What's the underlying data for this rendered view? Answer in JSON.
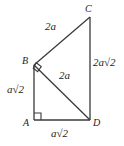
{
  "figure": {
    "type": "geometry-diagram",
    "background_color": "#ffffff",
    "stroke_color": "#3a3a3a",
    "text_color": "#1c1c1c",
    "vertices": [
      {
        "name": "A",
        "label": "A",
        "x": 34,
        "y": 120
      },
      {
        "name": "B",
        "label": "B",
        "x": 34,
        "y": 65
      },
      {
        "name": "C",
        "label": "C",
        "x": 90,
        "y": 17
      },
      {
        "name": "D",
        "label": "D",
        "x": 90,
        "y": 120
      }
    ],
    "segments": [
      {
        "name": "AB",
        "from": "A",
        "to": "B",
        "length_label": "a√2"
      },
      {
        "name": "BC",
        "from": "B",
        "to": "C",
        "length_label": "2a"
      },
      {
        "name": "CD",
        "from": "C",
        "to": "D",
        "length_label": "2a√2"
      },
      {
        "name": "AD",
        "from": "A",
        "to": "D",
        "length_label": "a√2"
      },
      {
        "name": "BD",
        "from": "B",
        "to": "D",
        "length_label": "2a"
      }
    ],
    "right_angles": [
      {
        "at": "A",
        "style": "square"
      },
      {
        "at": "B",
        "style": "rotated-square"
      }
    ],
    "labels": {
      "vertex_a": "A",
      "vertex_b": "B",
      "vertex_c": "C",
      "vertex_d": "D",
      "side_bc": {
        "coefficient": "2",
        "variable": "a",
        "radicand": ""
      },
      "side_cd": {
        "coefficient": "2",
        "variable": "a",
        "radicand": "2"
      },
      "side_bd": {
        "coefficient": "2",
        "variable": "a",
        "radicand": ""
      },
      "side_ab": {
        "coefficient": "",
        "variable": "a",
        "radicand": "2"
      },
      "side_ad": {
        "coefficient": "",
        "variable": "a",
        "radicand": "2"
      }
    }
  }
}
